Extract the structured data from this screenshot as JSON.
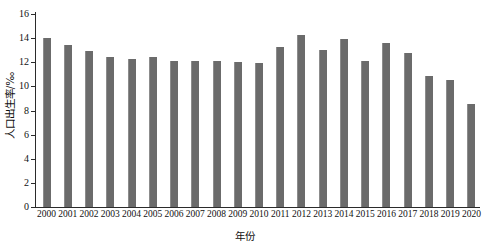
{
  "chart_data": {
    "type": "bar",
    "title": "",
    "xlabel": "年份",
    "ylabel": "人口出生率/‰",
    "categories": [
      "2000",
      "2001",
      "2002",
      "2003",
      "2004",
      "2005",
      "2006",
      "2007",
      "2008",
      "2009",
      "2010",
      "2011",
      "2012",
      "2013",
      "2014",
      "2015",
      "2016",
      "2017",
      "2018",
      "2019",
      "2020"
    ],
    "values": [
      14.0,
      13.4,
      12.9,
      12.4,
      12.3,
      12.4,
      12.1,
      12.1,
      12.1,
      12.0,
      11.9,
      13.3,
      14.3,
      13.0,
      13.9,
      12.1,
      13.6,
      12.8,
      10.9,
      10.5,
      8.5
    ],
    "series": [
      {
        "name": "人口出生率",
        "values": [
          14.0,
          13.4,
          12.9,
          12.4,
          12.3,
          12.4,
          12.1,
          12.1,
          12.1,
          12.0,
          11.9,
          13.3,
          14.3,
          13.0,
          13.9,
          12.1,
          13.6,
          12.8,
          10.9,
          10.5,
          8.5
        ]
      }
    ],
    "ylim": [
      0,
      16
    ],
    "yticks": [
      0,
      2,
      4,
      6,
      8,
      10,
      12,
      14,
      16
    ],
    "ytick_labels": [
      "0",
      "2",
      "4",
      "6",
      "8",
      "10",
      "12",
      "14",
      "16"
    ],
    "grid": false,
    "legend": false,
    "legend_position": "none",
    "bar_color": "#6b6b6b",
    "axis_color": "#2b2b2b",
    "background_color": "#ffffff"
  }
}
